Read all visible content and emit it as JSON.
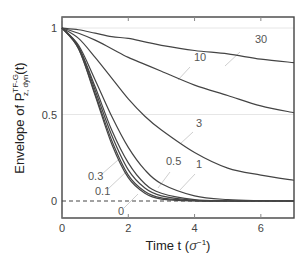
{
  "chart_data": {
    "type": "line",
    "title": "",
    "xlabel": "Time t (σ⁻¹)",
    "ylabel": "Envelope of P_{z,dyn}^{TF-G}(t)",
    "xlim": [
      0,
      7
    ],
    "ylim": [
      -0.1,
      1.06
    ],
    "xticks": [
      "0",
      "2",
      "4",
      "6"
    ],
    "yticks": [
      "0",
      "0.5",
      "1"
    ],
    "grid": "horizontal at 0.5 and 1",
    "reference_line": {
      "y": 0,
      "style": "dashed"
    },
    "x": [
      0,
      0.5,
      1,
      1.5,
      2,
      2.5,
      3,
      4,
      5,
      6,
      7
    ],
    "series": [
      {
        "name": "0",
        "values": [
          1,
          0.88,
          0.61,
          0.33,
          0.135,
          0.045,
          0.011,
          0,
          0,
          0,
          0
        ]
      },
      {
        "name": "0.1",
        "values": [
          1,
          0.88,
          0.62,
          0.35,
          0.15,
          0.055,
          0.018,
          0.002,
          0,
          0,
          0
        ]
      },
      {
        "name": "0.3",
        "values": [
          1,
          0.89,
          0.64,
          0.38,
          0.18,
          0.075,
          0.03,
          0.004,
          0,
          0,
          0
        ]
      },
      {
        "name": "0.5",
        "values": [
          1,
          0.89,
          0.66,
          0.41,
          0.22,
          0.1,
          0.045,
          0.008,
          0.001,
          0,
          0
        ]
      },
      {
        "name": "1",
        "values": [
          1,
          0.9,
          0.7,
          0.49,
          0.31,
          0.18,
          0.1,
          0.03,
          0.008,
          0.002,
          0
        ]
      },
      {
        "name": "3",
        "values": [
          1,
          0.94,
          0.83,
          0.71,
          0.59,
          0.49,
          0.41,
          0.28,
          0.19,
          0.15,
          0.12
        ]
      },
      {
        "name": "10",
        "values": [
          1,
          0.97,
          0.93,
          0.88,
          0.83,
          0.79,
          0.75,
          0.67,
          0.61,
          0.55,
          0.51
        ]
      },
      {
        "name": "30",
        "values": [
          1,
          0.99,
          0.97,
          0.95,
          0.94,
          0.92,
          0.9,
          0.87,
          0.85,
          0.82,
          0.8
        ]
      }
    ],
    "annotations": [
      {
        "text": "30",
        "label_x": 255,
        "label_y": 43,
        "line": [
          240,
          52,
          225,
          66
        ]
      },
      {
        "text": "10",
        "label_x": 194,
        "label_y": 61,
        "line": [
          190,
          67,
          178,
          80
        ]
      },
      {
        "text": "3",
        "label_x": 196,
        "label_y": 127,
        "line": [
          193,
          132,
          180,
          144
        ]
      },
      {
        "text": "0.5",
        "label_x": 166,
        "label_y": 165,
        "line": [
          170,
          172,
          158,
          188
        ]
      },
      {
        "text": "1",
        "label_x": 196,
        "label_y": 168,
        "line": [
          195,
          174,
          180,
          190
        ]
      },
      {
        "text": "0.3",
        "label_x": 88,
        "label_y": 180,
        "line": [
          102,
          174,
          118,
          160
        ]
      },
      {
        "text": "0.1",
        "label_x": 95,
        "label_y": 195,
        "line": [
          108,
          189,
          126,
          172
        ]
      },
      {
        "text": "0",
        "label_x": 118,
        "label_y": 215,
        "line": [
          124,
          208,
          138,
          194
        ]
      }
    ]
  },
  "axes": {
    "x_title": "Time t (",
    "x_title_sigma": "σ",
    "x_title_exp": "−1",
    "x_title_close": ")",
    "y_title_prefix": "Envelope of P",
    "y_title_sup": "TF-G",
    "y_title_sub": "z, dyn",
    "y_title_suffix": "(t)"
  },
  "colors": {
    "curve": "#444444",
    "frame": "#444444",
    "grid": "#e6e6e6",
    "leader": "#cfcfcf"
  }
}
